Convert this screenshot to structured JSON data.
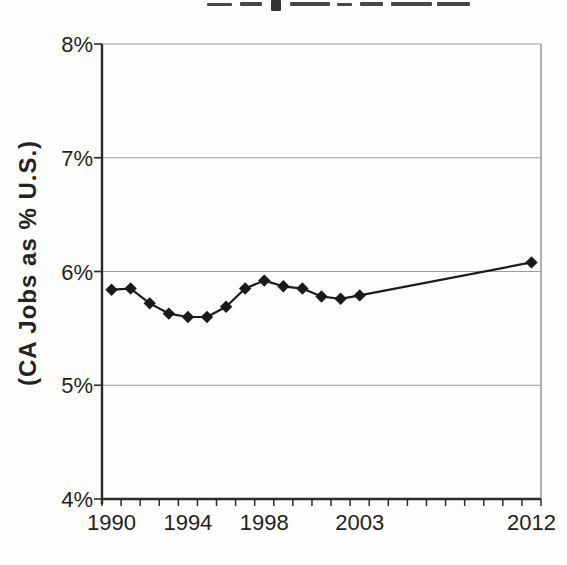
{
  "chart_data": {
    "type": "line",
    "ylabel": "(CA Jobs as % U.S.)",
    "xlabel": "",
    "ylim": [
      4,
      8
    ],
    "grid": "horizontal",
    "legend": "none",
    "y_ticks": [
      {
        "value": 8,
        "label": "8%"
      },
      {
        "value": 7,
        "label": "7%"
      },
      {
        "value": 6,
        "label": "6%"
      },
      {
        "value": 5,
        "label": "5%"
      },
      {
        "value": 4,
        "label": "4%"
      }
    ],
    "x_axis": {
      "start_year": 1990,
      "end_year": 2012,
      "minor_tick_every": 1
    },
    "x_tick_labels": [
      {
        "year": 1990,
        "label": "1990"
      },
      {
        "year": 1994,
        "label": "1994"
      },
      {
        "year": 1998,
        "label": "1998"
      },
      {
        "year": 2003,
        "label": "2003"
      },
      {
        "year": 2012,
        "label": "2012"
      }
    ],
    "series": [
      {
        "name": "CA Jobs as % U.S.",
        "marker": "diamond",
        "points": [
          [
            1990,
            5.84
          ],
          [
            1991,
            5.85
          ],
          [
            1992,
            5.72
          ],
          [
            1993,
            5.63
          ],
          [
            1994,
            5.6
          ],
          [
            1995,
            5.6
          ],
          [
            1996,
            5.69
          ],
          [
            1997,
            5.85
          ],
          [
            1998,
            5.92
          ],
          [
            1999,
            5.87
          ],
          [
            2000,
            5.85
          ],
          [
            2001,
            5.78
          ],
          [
            2002,
            5.76
          ],
          [
            2003,
            5.79
          ],
          [
            2012,
            6.08
          ]
        ]
      }
    ],
    "colors": {
      "line": "#1c1c1c",
      "marker": "#1a1a1a",
      "axis": "#2b2b2b",
      "grid": "#9b9b9b",
      "border": "#8e8e8e",
      "text": "#1f1f1f"
    }
  }
}
